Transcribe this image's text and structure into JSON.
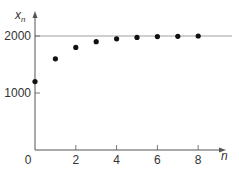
{
  "chart_data": {
    "type": "scatter",
    "title": "",
    "xlabel": "n",
    "ylabel": "x_n",
    "ylabel_main": "x",
    "ylabel_sub": "n",
    "x": [
      0,
      1,
      2,
      3,
      4,
      5,
      6,
      7,
      8
    ],
    "values": [
      1200,
      1600,
      1800,
      1900,
      1950,
      1975,
      1990,
      1995,
      2000
    ],
    "xlim": [
      0,
      9
    ],
    "ylim": [
      0,
      2200
    ],
    "x_ticks": [
      0,
      2,
      4,
      6,
      8
    ],
    "x_tick_labels": [
      "0",
      "2",
      "4",
      "6",
      "8"
    ],
    "y_ticks": [
      1000,
      2000
    ],
    "y_tick_labels": [
      "1000",
      "2000"
    ],
    "reference_line": {
      "y": 2000,
      "style": "horizontal asymptote"
    },
    "grid": false,
    "legend": null,
    "marker_color": "#111111",
    "axis_color": "#555555"
  },
  "caption": "Figure"
}
